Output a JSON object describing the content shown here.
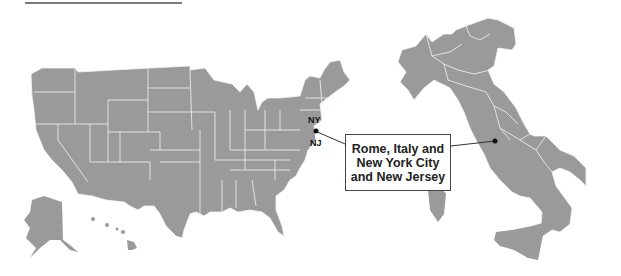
{
  "figure": {
    "type": "locator-map",
    "maps": [
      {
        "name": "United States",
        "fill": "#9a9a9a",
        "border": "#f2f2f2"
      },
      {
        "name": "Italy",
        "fill": "#9a9a9a",
        "border": "#f2f2f2"
      }
    ],
    "labels": {
      "ny": "NY",
      "nj": "NJ"
    },
    "callout": {
      "text": "Rome, Italy and\nNew York City\nand New Jersey"
    },
    "markers": [
      {
        "name": "new-york-city-marker",
        "color": "#111111"
      },
      {
        "name": "rome-marker",
        "color": "#111111"
      }
    ],
    "colors": {
      "land": "#9a9a9a",
      "borders": "#f2f2f2",
      "leader_line": "#333333",
      "rule": "#7a7a7a"
    }
  }
}
